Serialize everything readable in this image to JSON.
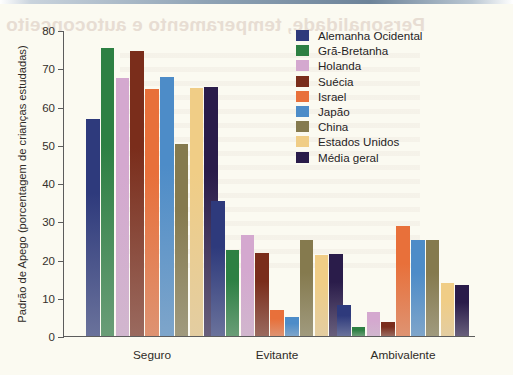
{
  "chart_data": {
    "type": "bar",
    "title": "",
    "xlabel": "",
    "ylabel": "Padrão de Apego (porcentagem de crianças estudadas)",
    "ylim": [
      0,
      80
    ],
    "ytick_labels": [
      "80",
      "70",
      "60",
      "50",
      "40",
      "30",
      "20",
      "10",
      "0"
    ],
    "yticks": [
      80,
      70,
      60,
      50,
      40,
      30,
      20,
      10,
      0
    ],
    "grid": false,
    "legend_position": "upper-right-inside",
    "categories": [
      "Seguro",
      "Evitante",
      "Ambivalente"
    ],
    "series": [
      {
        "name": "Alemanha Ocidental",
        "color": "#2e3a7c",
        "values": [
          56.8,
          35.4,
          8.0
        ]
      },
      {
        "name": "Grã-Bretanha",
        "color": "#2d8043",
        "values": [
          75.2,
          22.4,
          2.4
        ]
      },
      {
        "name": "Holanda",
        "color": "#d4a8cf",
        "values": [
          67.4,
          26.4,
          6.2
        ]
      },
      {
        "name": "Suécia",
        "color": "#7a2d1b",
        "values": [
          74.6,
          21.8,
          3.6
        ]
      },
      {
        "name": "Israel",
        "color": "#e8703a",
        "values": [
          64.6,
          6.7,
          28.8
        ]
      },
      {
        "name": "Japão",
        "color": "#4d8cc8",
        "values": [
          67.8,
          5.0,
          25.0
        ]
      },
      {
        "name": "China",
        "color": "#857a4e",
        "values": [
          50.1,
          25.1,
          25.0
        ]
      },
      {
        "name": "Estados Unidos",
        "color": "#f0cd86",
        "values": [
          64.8,
          21.2,
          13.9
        ]
      },
      {
        "name": "Média geral",
        "color": "#2a1c4a",
        "values": [
          65.2,
          21.4,
          13.4
        ]
      }
    ]
  },
  "legend": {
    "items": [
      {
        "label": "Alemanha Ocidental",
        "color": "#2e3a7c"
      },
      {
        "label": "Grã-Bretanha",
        "color": "#2d8043"
      },
      {
        "label": "Holanda",
        "color": "#d4a8cf"
      },
      {
        "label": "Suécia",
        "color": "#7a2d1b"
      },
      {
        "label": "Israel",
        "color": "#e8703a"
      },
      {
        "label": "Japão",
        "color": "#4d8cc8"
      },
      {
        "label": "China",
        "color": "#857a4e"
      },
      {
        "label": "Estados Unidos",
        "color": "#f0cd86"
      },
      {
        "label": "Média geral",
        "color": "#2a1c4a"
      }
    ]
  },
  "artefacts": {
    "bleed_through_title": "Personalidade, temperamento e autoconceito"
  }
}
